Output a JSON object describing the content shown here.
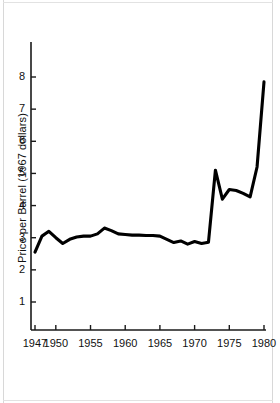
{
  "figure": {
    "accent_color": "#000000",
    "background_color": "#ffffff",
    "axis_color": "#1a1a1a",
    "line_color": "#000000"
  },
  "chart_data": {
    "type": "line",
    "title": "",
    "xlabel": "",
    "ylabel": "Price per Barrel (1967 dollars)",
    "xlim": [
      1946.5,
      1980.5
    ],
    "ylim": [
      0,
      9.1
    ],
    "grid": false,
    "legend": null,
    "xticks": [
      1947,
      1950,
      1955,
      1960,
      1965,
      1970,
      1975,
      1980
    ],
    "xtick_labels": [
      "1947",
      "1950",
      "1955",
      "1960",
      "1965",
      "1970",
      "1975",
      "1980"
    ],
    "yticks": [
      1,
      2,
      3,
      4,
      5,
      6,
      7,
      8
    ],
    "ytick_labels": [
      "1",
      "2",
      "3",
      "4",
      "5",
      "6",
      "7",
      "8"
    ],
    "x": [
      1947,
      1948,
      1949,
      1950,
      1951,
      1952,
      1953,
      1954,
      1955,
      1956,
      1957,
      1958,
      1959,
      1960,
      1961,
      1962,
      1963,
      1964,
      1965,
      1966,
      1967,
      1968,
      1969,
      1970,
      1971,
      1972,
      1973,
      1974,
      1975,
      1976,
      1977,
      1978,
      1979,
      1980
    ],
    "values": [
      2.55,
      3.05,
      3.2,
      3.0,
      2.82,
      2.95,
      3.02,
      3.05,
      3.05,
      3.12,
      3.3,
      3.22,
      3.12,
      3.1,
      3.08,
      3.08,
      3.07,
      3.07,
      3.05,
      2.95,
      2.85,
      2.9,
      2.8,
      2.88,
      2.82,
      2.86,
      5.1,
      4.2,
      4.5,
      4.47,
      4.38,
      4.27,
      5.2,
      7.85
    ],
    "series": [
      {
        "name": "Price per Barrel (1967 dollars)",
        "values": [
          2.55,
          3.05,
          3.2,
          3.0,
          2.82,
          2.95,
          3.02,
          3.05,
          3.05,
          3.12,
          3.3,
          3.22,
          3.12,
          3.1,
          3.08,
          3.08,
          3.07,
          3.07,
          3.05,
          2.95,
          2.85,
          2.9,
          2.8,
          2.88,
          2.82,
          2.86,
          5.1,
          4.2,
          4.5,
          4.47,
          4.38,
          4.27,
          5.2,
          7.85
        ]
      }
    ]
  }
}
